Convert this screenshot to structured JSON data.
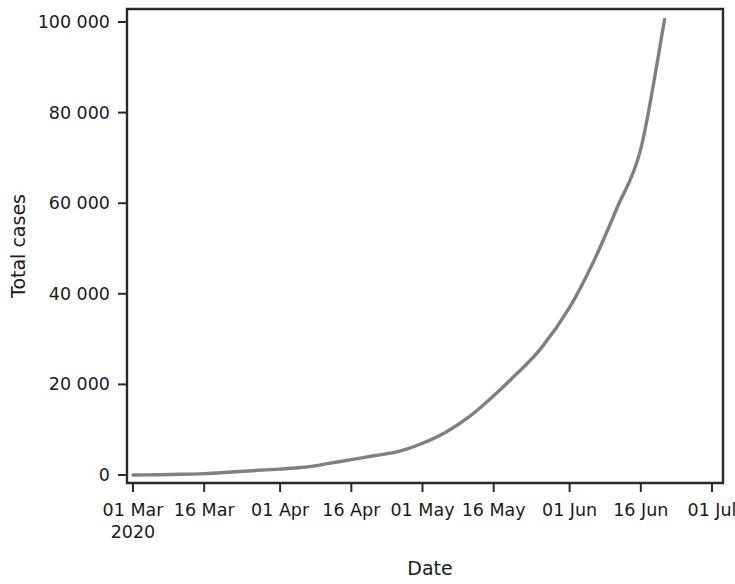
{
  "chart_data": {
    "type": "line",
    "title": "",
    "xlabel": "Date",
    "ylabel": "Total cases",
    "grid": false,
    "legend": null,
    "line_color": "#808080",
    "axis_color": "#2a2a2a",
    "background_color": "#ffffff",
    "xlim": [
      "2020-03-01",
      "2020-07-01"
    ],
    "ylim": [
      0,
      100000
    ],
    "x_tick_labels": [
      "01 Mar",
      "16 Mar",
      "01 Apr",
      "16 Apr",
      "01 May",
      "16 May",
      "01 Jun",
      "16 Jun",
      "01 Jul"
    ],
    "x_tick_sublabel": "2020",
    "x_tick_dates": [
      "2020-03-01",
      "2020-03-16",
      "2020-04-01",
      "2020-04-16",
      "2020-05-01",
      "2020-05-16",
      "2020-06-01",
      "2020-06-16",
      "2020-07-01"
    ],
    "y_tick_labels": [
      "0",
      "20 000",
      "40 000",
      "60 000",
      "80 000",
      "100 000"
    ],
    "y_tick_values": [
      0,
      20000,
      40000,
      60000,
      80000,
      100000
    ],
    "series": [
      {
        "name": "Total cases",
        "x": [
          "2020-03-01",
          "2020-03-06",
          "2020-03-11",
          "2020-03-16",
          "2020-03-21",
          "2020-03-26",
          "2020-04-01",
          "2020-04-06",
          "2020-04-11",
          "2020-04-16",
          "2020-04-21",
          "2020-04-26",
          "2020-05-01",
          "2020-05-06",
          "2020-05-11",
          "2020-05-16",
          "2020-05-21",
          "2020-05-26",
          "2020-06-01",
          "2020-06-06",
          "2020-06-11",
          "2020-06-16",
          "2020-06-21"
        ],
        "values": [
          0,
          60,
          150,
          300,
          600,
          950,
          1300,
          1700,
          2500,
          3400,
          4300,
          5200,
          7000,
          9500,
          13000,
          17500,
          22500,
          28000,
          37000,
          47000,
          59000,
          72000,
          100500
        ]
      }
    ]
  }
}
